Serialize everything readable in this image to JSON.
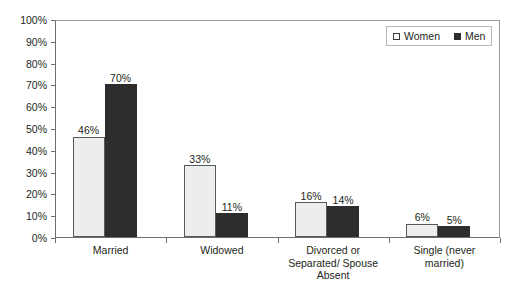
{
  "chart_data": {
    "type": "bar",
    "title": "",
    "subtitle": "",
    "xlabel": "",
    "ylabel": "",
    "ylim": [
      0,
      100
    ],
    "grid": false,
    "legend_position": "top-right",
    "categories": [
      "Married",
      "Divorced or\nSeparated/ Spouse\nAbsent",
      "Widowed",
      "Single (never\nmarried)"
    ],
    "category_labels": [
      {
        "lines": [
          "Married"
        ]
      },
      {
        "lines": [
          "Widowed"
        ]
      },
      {
        "lines": [
          "Divorced or",
          "Separated/ Spouse",
          "Absent"
        ]
      },
      {
        "lines": [
          "Single (never",
          "married)"
        ]
      }
    ],
    "series": [
      {
        "name": "Women",
        "color": "#eceded",
        "values": [
          46,
          33,
          16,
          6
        ],
        "value_labels": [
          "46%",
          "33%",
          "16%",
          "6%"
        ]
      },
      {
        "name": "Men",
        "color": "#2e2c2d",
        "values": [
          70,
          11,
          14,
          5
        ],
        "value_labels": [
          "70%",
          "11%",
          "14%",
          "5%"
        ]
      }
    ],
    "y_ticks": [
      0,
      10,
      20,
      30,
      40,
      50,
      60,
      70,
      80,
      90,
      100
    ],
    "y_tick_labels": [
      "0%",
      "10%",
      "20%",
      "30%",
      "40%",
      "50%",
      "60%",
      "70%",
      "80%",
      "90%",
      "100%"
    ]
  },
  "legend": {
    "items": [
      {
        "label": "Women",
        "swatch": "women"
      },
      {
        "label": "Men",
        "swatch": "men"
      }
    ]
  }
}
